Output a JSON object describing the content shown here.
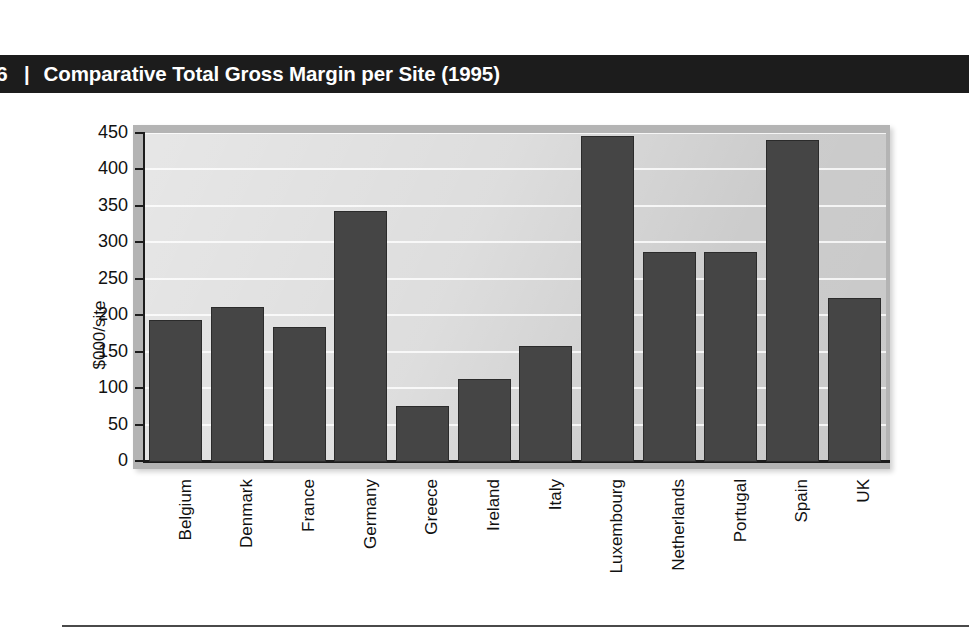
{
  "header": {
    "page_number": "6",
    "separator": "|",
    "title": "Comparative Total Gross Margin per Site (1995)"
  },
  "chart_data": {
    "type": "bar",
    "title": "Comparative Total Gross Margin per Site (1995)",
    "xlabel": "",
    "ylabel": "$000/site",
    "ylim": [
      0,
      450
    ],
    "ytick_step": 50,
    "yticks": [
      0,
      50,
      100,
      150,
      200,
      250,
      300,
      350,
      400,
      450
    ],
    "ytick_labels": [
      "0",
      "50",
      "100",
      "150",
      "200",
      "250",
      "300",
      "350",
      "400",
      "450"
    ],
    "grid": true,
    "legend": null,
    "bar_color": "#454545",
    "plot_background": "#c9c9c9",
    "categories": [
      "Belgium",
      "Denmark",
      "France",
      "Germany",
      "Greece",
      "Ireland",
      "Italy",
      "Luxembourg",
      "Netherlands",
      "Portugal",
      "Spain",
      "UK"
    ],
    "values": [
      195,
      212,
      185,
      345,
      77,
      114,
      159,
      447,
      288,
      288,
      442,
      225
    ]
  },
  "footer": {
    "rule": ""
  }
}
